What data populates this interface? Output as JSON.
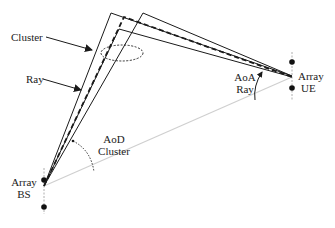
{
  "labels": {
    "cluster": "Cluster",
    "ray": "Ray",
    "aoa_line1": "AoA",
    "aoa_line2": "Ray",
    "aod_line1": "AoD",
    "aod_line2": "Cluster",
    "ue_line1": "Array",
    "ue_line2": "UE",
    "bs_line1": "Array",
    "bs_line2": "BS"
  },
  "colors": {
    "line": "#1a1a1a",
    "los": "#cfcfcf"
  }
}
